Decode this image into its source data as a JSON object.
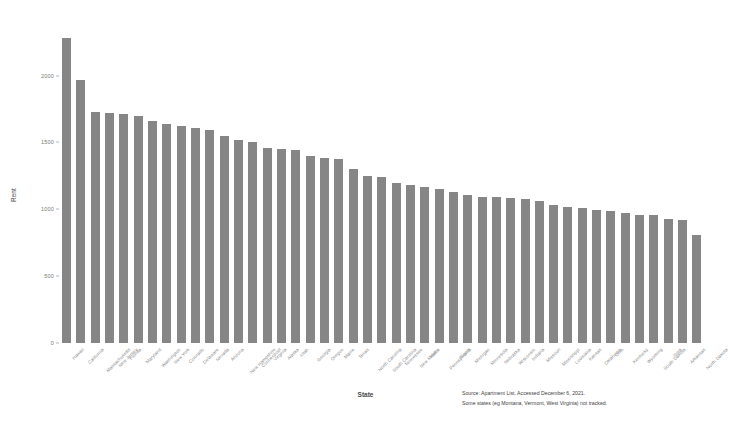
{
  "chart_data": {
    "type": "bar",
    "title": "",
    "xlabel": "State",
    "ylabel": "Rent",
    "ylim": [
      0,
      2400
    ],
    "grid": false,
    "legend": null,
    "bar_color": "#868686",
    "yticks": [
      0,
      500,
      1000,
      1500,
      2000
    ],
    "ytick_labels": [
      "0",
      "500",
      "1000",
      "1500",
      "2000"
    ],
    "categories": [
      "Hawaii",
      "California",
      "Massachusetts",
      "New Jersey",
      "Florida",
      "Maryland",
      "Washington",
      "New York",
      "Colorado",
      "Delaware",
      "Nevada",
      "Arizona",
      "New Hampshire",
      "Connecticut",
      "Virginia",
      "Alaska",
      "Utah",
      "Georgia",
      "Oregon",
      "Maine",
      "Texas",
      "North Carolina",
      "South Carolina",
      "Tennessee",
      "New Mexico",
      "Idaho",
      "Pennsylvania",
      "Illinois",
      "Michigan",
      "Minnesota",
      "Nebraska",
      "Wisconsin",
      "Indiana",
      "Missouri",
      "Mississippi",
      "Louisiana",
      "Kansas",
      "Oklahoma",
      "Ohio",
      "Kentucky",
      "Wyoming",
      "South Dakota",
      "Iowa",
      "Arkansas",
      "North Dakota"
    ],
    "values": [
      2280,
      1965,
      1730,
      1720,
      1715,
      1700,
      1660,
      1640,
      1620,
      1610,
      1595,
      1545,
      1520,
      1505,
      1455,
      1450,
      1440,
      1395,
      1380,
      1375,
      1300,
      1250,
      1240,
      1195,
      1180,
      1170,
      1155,
      1130,
      1110,
      1095,
      1090,
      1085,
      1080,
      1065,
      1035,
      1020,
      1010,
      995,
      985,
      975,
      960,
      955,
      930,
      920,
      810
    ]
  },
  "annotations": {
    "source_line_1": "Source: Apartment List. Accessed December 6, 2021.",
    "source_line_2": "Some states (eg Montana, Vermont, West Virginia) not tracked."
  }
}
